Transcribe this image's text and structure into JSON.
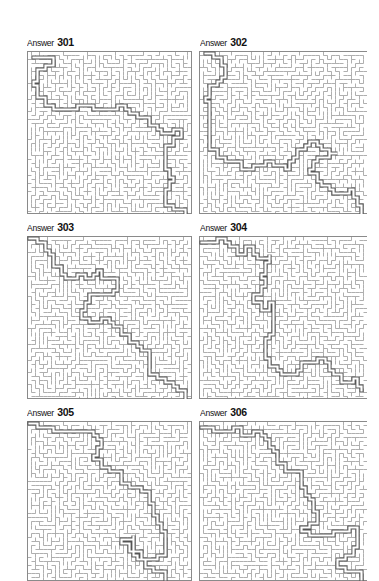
{
  "page": {
    "background": "#ffffff"
  },
  "style": {
    "wall_color": "#9a9a9a",
    "path_color": "#555555",
    "border_color": "#8a8a8a"
  },
  "answers": [
    {
      "word": "Answer",
      "number": "301",
      "label_pos": [
        27,
        37
      ],
      "maze_box": [
        27,
        51,
        166,
        163
      ],
      "seed": 301,
      "path": [
        [
          0.02,
          0.02
        ],
        [
          0.1,
          0.03
        ],
        [
          0.14,
          0.08
        ],
        [
          0.06,
          0.12
        ],
        [
          0.03,
          0.2
        ],
        [
          0.05,
          0.27
        ],
        [
          0.1,
          0.32
        ],
        [
          0.2,
          0.34
        ],
        [
          0.3,
          0.33
        ],
        [
          0.45,
          0.34
        ],
        [
          0.55,
          0.32
        ],
        [
          0.62,
          0.37
        ],
        [
          0.7,
          0.4
        ],
        [
          0.75,
          0.45
        ],
        [
          0.82,
          0.5
        ],
        [
          0.9,
          0.47
        ],
        [
          0.96,
          0.52
        ],
        [
          0.9,
          0.58
        ],
        [
          0.84,
          0.62
        ],
        [
          0.86,
          0.72
        ],
        [
          0.9,
          0.8
        ],
        [
          0.84,
          0.88
        ],
        [
          0.86,
          0.95
        ],
        [
          0.98,
          0.99
        ]
      ]
    },
    {
      "word": "Answer",
      "number": "302",
      "label_pos": [
        200,
        37
      ],
      "maze_box": [
        199,
        51,
        168,
        163
      ],
      "seed": 302,
      "path": [
        [
          0.03,
          0.01
        ],
        [
          0.1,
          0.03
        ],
        [
          0.14,
          0.1
        ],
        [
          0.12,
          0.18
        ],
        [
          0.05,
          0.22
        ],
        [
          0.03,
          0.3
        ],
        [
          0.05,
          0.4
        ],
        [
          0.04,
          0.5
        ],
        [
          0.06,
          0.6
        ],
        [
          0.1,
          0.66
        ],
        [
          0.2,
          0.68
        ],
        [
          0.25,
          0.72
        ],
        [
          0.32,
          0.7
        ],
        [
          0.4,
          0.68
        ],
        [
          0.5,
          0.72
        ],
        [
          0.58,
          0.6
        ],
        [
          0.66,
          0.56
        ],
        [
          0.74,
          0.6
        ],
        [
          0.82,
          0.62
        ],
        [
          0.7,
          0.68
        ],
        [
          0.66,
          0.76
        ],
        [
          0.72,
          0.82
        ],
        [
          0.8,
          0.88
        ],
        [
          0.9,
          0.86
        ],
        [
          0.94,
          0.94
        ],
        [
          0.98,
          0.99
        ]
      ]
    },
    {
      "word": "Answer",
      "number": "303",
      "label_pos": [
        27,
        222
      ],
      "maze_box": [
        27,
        236,
        166,
        163
      ],
      "seed": 303,
      "path": [
        [
          0.01,
          0.01
        ],
        [
          0.08,
          0.03
        ],
        [
          0.13,
          0.1
        ],
        [
          0.16,
          0.18
        ],
        [
          0.22,
          0.24
        ],
        [
          0.3,
          0.22
        ],
        [
          0.36,
          0.26
        ],
        [
          0.42,
          0.2
        ],
        [
          0.46,
          0.26
        ],
        [
          0.52,
          0.24
        ],
        [
          0.54,
          0.32
        ],
        [
          0.48,
          0.36
        ],
        [
          0.42,
          0.34
        ],
        [
          0.38,
          0.4
        ],
        [
          0.34,
          0.46
        ],
        [
          0.32,
          0.5
        ],
        [
          0.38,
          0.52
        ],
        [
          0.44,
          0.5
        ],
        [
          0.52,
          0.54
        ],
        [
          0.58,
          0.6
        ],
        [
          0.62,
          0.66
        ],
        [
          0.7,
          0.7
        ],
        [
          0.74,
          0.76
        ],
        [
          0.76,
          0.84
        ],
        [
          0.84,
          0.9
        ],
        [
          0.92,
          0.94
        ],
        [
          0.98,
          0.99
        ]
      ]
    },
    {
      "word": "Answer",
      "number": "304",
      "label_pos": [
        200,
        222
      ],
      "maze_box": [
        199,
        236,
        168,
        163
      ],
      "seed": 304,
      "path": [
        [
          0.01,
          0.03
        ],
        [
          0.1,
          0.01
        ],
        [
          0.18,
          0.04
        ],
        [
          0.22,
          0.1
        ],
        [
          0.28,
          0.06
        ],
        [
          0.34,
          0.12
        ],
        [
          0.42,
          0.1
        ],
        [
          0.4,
          0.18
        ],
        [
          0.36,
          0.26
        ],
        [
          0.4,
          0.3
        ],
        [
          0.36,
          0.36
        ],
        [
          0.32,
          0.4
        ],
        [
          0.36,
          0.44
        ],
        [
          0.42,
          0.4
        ],
        [
          0.44,
          0.48
        ],
        [
          0.44,
          0.56
        ],
        [
          0.42,
          0.62
        ],
        [
          0.38,
          0.68
        ],
        [
          0.38,
          0.74
        ],
        [
          0.42,
          0.8
        ],
        [
          0.48,
          0.86
        ],
        [
          0.56,
          0.84
        ],
        [
          0.62,
          0.78
        ],
        [
          0.7,
          0.74
        ],
        [
          0.76,
          0.78
        ],
        [
          0.8,
          0.84
        ],
        [
          0.86,
          0.9
        ],
        [
          0.92,
          0.88
        ],
        [
          0.98,
          0.96
        ]
      ]
    },
    {
      "word": "Answer",
      "number": "305",
      "label_pos": [
        27,
        407
      ],
      "maze_box": [
        27,
        421,
        166,
        160
      ],
      "seed": 305,
      "path": [
        [
          0.01,
          0.01
        ],
        [
          0.1,
          0.02
        ],
        [
          0.18,
          0.05
        ],
        [
          0.26,
          0.04
        ],
        [
          0.34,
          0.06
        ],
        [
          0.42,
          0.1
        ],
        [
          0.44,
          0.16
        ],
        [
          0.4,
          0.22
        ],
        [
          0.46,
          0.28
        ],
        [
          0.54,
          0.32
        ],
        [
          0.58,
          0.38
        ],
        [
          0.66,
          0.42
        ],
        [
          0.74,
          0.44
        ],
        [
          0.76,
          0.52
        ],
        [
          0.78,
          0.6
        ],
        [
          0.82,
          0.68
        ],
        [
          0.86,
          0.76
        ],
        [
          0.84,
          0.84
        ],
        [
          0.76,
          0.86
        ],
        [
          0.68,
          0.84
        ],
        [
          0.62,
          0.78
        ],
        [
          0.58,
          0.74
        ],
        [
          0.64,
          0.72
        ],
        [
          0.66,
          0.82
        ],
        [
          0.72,
          0.92
        ],
        [
          0.8,
          0.96
        ],
        [
          0.86,
          0.94
        ],
        [
          0.84,
          0.99
        ]
      ]
    },
    {
      "word": "Answer",
      "number": "306",
      "label_pos": [
        200,
        407
      ],
      "maze_box": [
        199,
        421,
        168,
        160
      ],
      "seed": 306,
      "path": [
        [
          0.01,
          0.02
        ],
        [
          0.12,
          0.04
        ],
        [
          0.2,
          0.02
        ],
        [
          0.24,
          0.08
        ],
        [
          0.32,
          0.06
        ],
        [
          0.4,
          0.1
        ],
        [
          0.44,
          0.18
        ],
        [
          0.46,
          0.26
        ],
        [
          0.52,
          0.3
        ],
        [
          0.6,
          0.32
        ],
        [
          0.62,
          0.4
        ],
        [
          0.66,
          0.48
        ],
        [
          0.68,
          0.56
        ],
        [
          0.7,
          0.64
        ],
        [
          0.62,
          0.7
        ],
        [
          0.7,
          0.72
        ],
        [
          0.8,
          0.7
        ],
        [
          0.9,
          0.66
        ],
        [
          0.96,
          0.72
        ],
        [
          0.94,
          0.8
        ],
        [
          0.88,
          0.86
        ],
        [
          0.84,
          0.92
        ],
        [
          0.92,
          0.96
        ],
        [
          0.98,
          0.99
        ]
      ]
    }
  ]
}
